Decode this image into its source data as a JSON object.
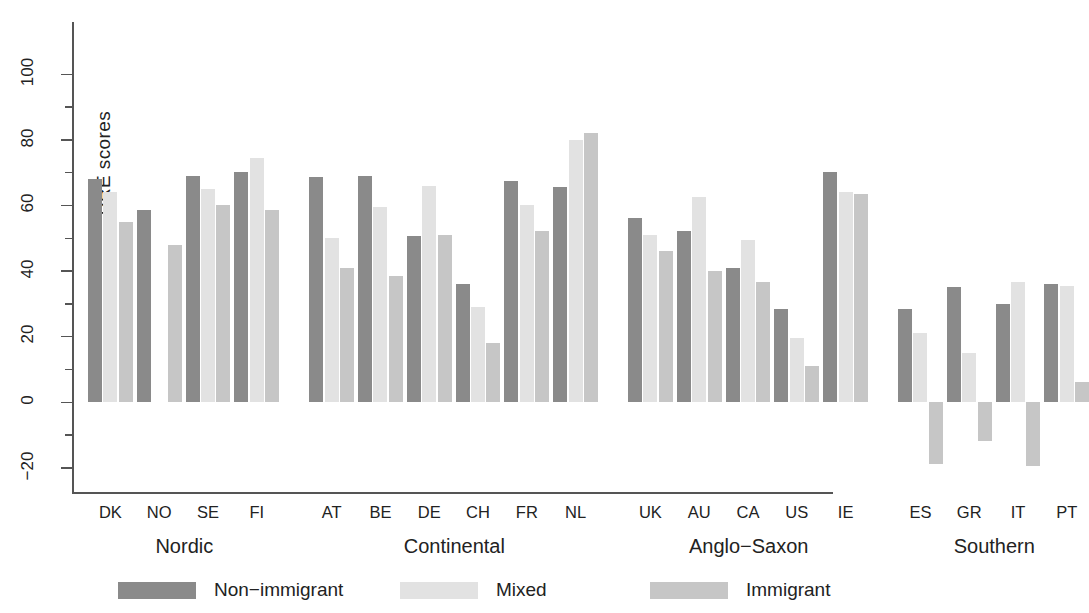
{
  "chart_data": {
    "type": "bar",
    "title": "",
    "xlabel": "",
    "ylabel": "PRE scores",
    "ylim": [
      -28,
      105
    ],
    "yticks": [
      -20,
      0,
      20,
      40,
      60,
      80,
      100
    ],
    "ytick_labels": [
      "-20",
      "0",
      "20",
      "40",
      "60",
      "80",
      "100"
    ],
    "minor_tick_step": 10,
    "grid": false,
    "legend_position": "bottom",
    "categories": [
      "DK",
      "NO",
      "SE",
      "FI",
      "AT",
      "BE",
      "DE",
      "CH",
      "FR",
      "NL",
      "UK",
      "AU",
      "CA",
      "US",
      "IE",
      "ES",
      "GR",
      "IT",
      "PT"
    ],
    "groups": [
      {
        "name": "Nordic",
        "categories": [
          "DK",
          "NO",
          "SE",
          "FI"
        ]
      },
      {
        "name": "Continental",
        "categories": [
          "AT",
          "BE",
          "DE",
          "CH",
          "FR",
          "NL"
        ]
      },
      {
        "name": "Anglo−Saxon",
        "categories": [
          "UK",
          "AU",
          "CA",
          "US",
          "IE"
        ]
      },
      {
        "name": "Southern",
        "categories": [
          "ES",
          "GR",
          "IT",
          "PT"
        ]
      }
    ],
    "series": [
      {
        "name": "Non-immigrant",
        "color": "#8a8a8a",
        "values": [
          68,
          58.5,
          69,
          70,
          68.5,
          69,
          50.5,
          36,
          67.5,
          65.5,
          56,
          52,
          41,
          28.5,
          70,
          28.5,
          35,
          30,
          36
        ]
      },
      {
        "name": "Mixed",
        "color": "#e2e2e2",
        "values": [
          64,
          null,
          65,
          74.5,
          50,
          59.5,
          66,
          29,
          60,
          80,
          51,
          62.5,
          49.5,
          19.5,
          64,
          21,
          15,
          36.5,
          35.5
        ]
      },
      {
        "name": "Immigrant",
        "color": "#c6c6c6",
        "values": [
          55,
          48,
          60,
          58.5,
          41,
          38.5,
          51,
          18,
          52,
          82,
          46,
          40,
          36.5,
          11,
          63.5,
          -19,
          -12,
          -19.5,
          6
        ]
      }
    ]
  },
  "legend": {
    "items": [
      {
        "label": "Non-immigrant",
        "color": "#8a8a8a"
      },
      {
        "label": "Mixed",
        "color": "#e2e2e2"
      },
      {
        "label": "Immigrant",
        "color": "#c6c6c6"
      }
    ]
  }
}
